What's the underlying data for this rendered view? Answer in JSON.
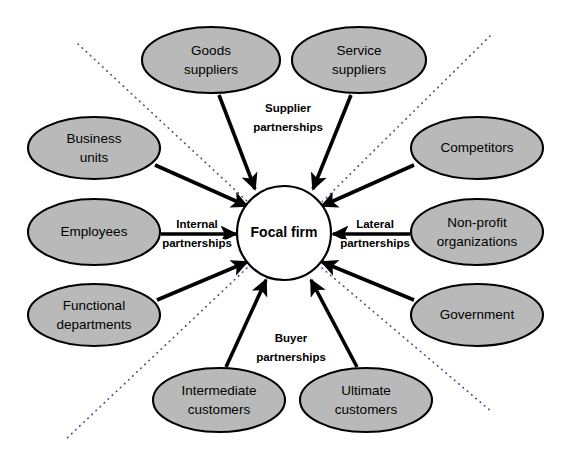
{
  "diagram": {
    "canvas": {
      "width": 571,
      "height": 462
    },
    "colors": {
      "node_fill": "#b9b9b9",
      "node_stroke": "#000000",
      "center_fill": "#ffffff",
      "center_stroke": "#000000",
      "arrow": "#000000",
      "divider": "#4a4a8a",
      "background": "#ffffff"
    },
    "center": {
      "label": "Focal firm",
      "cx": 284,
      "cy": 233,
      "rx": 47,
      "ry": 47
    },
    "nodes": [
      {
        "id": "goods-suppliers",
        "line1": "Goods",
        "line2": "suppliers",
        "cx": 211,
        "cy": 60,
        "rx": 69,
        "ry": 33
      },
      {
        "id": "service-suppliers",
        "line1": "Service",
        "line2": "suppliers",
        "cx": 359,
        "cy": 60,
        "rx": 67,
        "ry": 33
      },
      {
        "id": "business-units",
        "line1": "Business",
        "line2": "units",
        "cx": 94,
        "cy": 148,
        "rx": 66,
        "ry": 31
      },
      {
        "id": "competitors",
        "line1": "Competitors",
        "line2": "",
        "cx": 477,
        "cy": 148,
        "rx": 66,
        "ry": 31
      },
      {
        "id": "employees",
        "line1": "Employees",
        "line2": "",
        "cx": 94,
        "cy": 232,
        "rx": 66,
        "ry": 33
      },
      {
        "id": "non-profit-organizations",
        "line1": "Non-profit",
        "line2": "organizations",
        "cx": 477,
        "cy": 232,
        "rx": 66,
        "ry": 33
      },
      {
        "id": "functional-departments",
        "line1": "Functional",
        "line2": "departments",
        "cx": 94,
        "cy": 315,
        "rx": 66,
        "ry": 31
      },
      {
        "id": "government",
        "line1": "Government",
        "line2": "",
        "cx": 477,
        "cy": 315,
        "rx": 66,
        "ry": 31
      },
      {
        "id": "intermediate-customers",
        "line1": "Intermediate",
        "line2": "customers",
        "cx": 219,
        "cy": 400,
        "rx": 66,
        "ry": 32
      },
      {
        "id": "ultimate-customers",
        "line1": "Ultimate",
        "line2": "customers",
        "cx": 366,
        "cy": 400,
        "rx": 66,
        "ry": 32
      }
    ],
    "arrows": [
      {
        "id": "arrow-goods-suppliers",
        "from": "goods-suppliers",
        "x1": 219,
        "y1": 95,
        "x2": 255,
        "y2": 189
      },
      {
        "id": "arrow-service-suppliers",
        "from": "service-suppliers",
        "x1": 351,
        "y1": 95,
        "x2": 313,
        "y2": 189
      },
      {
        "id": "arrow-business-units",
        "from": "business-units",
        "x1": 155,
        "y1": 165,
        "x2": 247,
        "y2": 206
      },
      {
        "id": "arrow-competitors",
        "from": "competitors",
        "x1": 414,
        "y1": 165,
        "x2": 322,
        "y2": 206
      },
      {
        "id": "arrow-employees",
        "from": "employees",
        "x1": 161,
        "y1": 234,
        "x2": 236,
        "y2": 234
      },
      {
        "id": "arrow-non-profit-organizations",
        "from": "non-profit-organizations",
        "x1": 410,
        "y1": 234,
        "x2": 333,
        "y2": 234
      },
      {
        "id": "arrow-functional-departments",
        "from": "functional-departments",
        "x1": 157,
        "y1": 300,
        "x2": 247,
        "y2": 262
      },
      {
        "id": "arrow-government",
        "from": "government",
        "x1": 414,
        "y1": 300,
        "x2": 322,
        "y2": 262
      },
      {
        "id": "arrow-intermediate-customers",
        "from": "intermediate-customers",
        "x1": 226,
        "y1": 367,
        "x2": 266,
        "y2": 280
      },
      {
        "id": "arrow-ultimate-customers",
        "from": "ultimate-customers",
        "x1": 357,
        "y1": 367,
        "x2": 311,
        "y2": 280
      }
    ],
    "dividers": [
      {
        "id": "divider-top-left",
        "x1": 78,
        "y1": 44,
        "x2": 248,
        "y2": 202
      },
      {
        "id": "divider-top-right",
        "x1": 490,
        "y1": 36,
        "x2": 322,
        "y2": 202
      },
      {
        "id": "divider-bottom-left",
        "x1": 247,
        "y1": 268,
        "x2": 65,
        "y2": 440
      },
      {
        "id": "divider-bottom-right",
        "x1": 322,
        "y1": 268,
        "x2": 492,
        "y2": 412
      }
    ],
    "relationships": [
      {
        "id": "supplier-partnerships",
        "line1": "Supplier",
        "line2": "partnerships",
        "x": 288,
        "y": 118,
        "stacked": true
      },
      {
        "id": "internal-partnerships",
        "line1": "Internal",
        "line2": "partnerships",
        "x": 197,
        "y": 234,
        "stacked": true
      },
      {
        "id": "lateral-partnerships",
        "line1": "Lateral",
        "line2": "partnerships",
        "x": 375,
        "y": 234,
        "stacked": true
      },
      {
        "id": "buyer-partnerships",
        "line1": "Buyer",
        "line2": "partnerships",
        "x": 291,
        "y": 348,
        "stacked": true
      }
    ]
  }
}
